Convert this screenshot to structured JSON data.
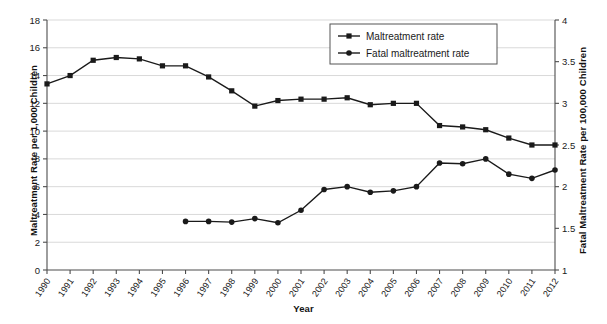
{
  "chart_data": {
    "type": "line",
    "title": "",
    "xlabel": "Year",
    "ylabel": "Maltreatment Rate per 1,000 Children",
    "ylabel_secondary": "Fatal Maltreatment Rate per 100,000 Children",
    "grid": true,
    "legend_position": "top-center",
    "ylim": [
      0,
      18
    ],
    "ylim_secondary": [
      1,
      4
    ],
    "yticks": [
      "0",
      "2",
      "4",
      "6",
      "8",
      "10",
      "12",
      "14",
      "16",
      "18"
    ],
    "yticks_secondary": [
      "1",
      "1.5",
      "2",
      "2.5",
      "3",
      "3.5",
      "4"
    ],
    "x": [
      1990,
      1991,
      1992,
      1993,
      1994,
      1995,
      1996,
      1997,
      1998,
      1999,
      2000,
      2001,
      2002,
      2003,
      2004,
      2005,
      2006,
      2007,
      2008,
      2009,
      2010,
      2011,
      2012
    ],
    "categories": [
      "1990",
      "1991",
      "1992",
      "1993",
      "1994",
      "1995",
      "1996",
      "1997",
      "1998",
      "1999",
      "2000",
      "2001",
      "2002",
      "2003",
      "2004",
      "2005",
      "2006",
      "2007",
      "2008",
      "2009",
      "2010",
      "2011",
      "2012"
    ],
    "series": [
      {
        "name": "Maltreatment rate",
        "axis": "left",
        "marker": "square",
        "color": "#1a1a1a",
        "values": [
          13.4,
          14.0,
          15.1,
          15.3,
          15.2,
          14.7,
          14.7,
          13.9,
          12.9,
          11.8,
          12.2,
          12.3,
          12.3,
          12.4,
          11.9,
          12.0,
          12.0,
          10.4,
          10.3,
          10.1,
          9.5,
          9.0,
          9.0
        ]
      },
      {
        "name": "Fatal maltreatment rate",
        "axis": "right",
        "marker": "circle",
        "color": "#1a1a1a",
        "values": [
          null,
          null,
          null,
          null,
          null,
          null,
          1.58,
          1.58,
          1.57,
          1.62,
          1.56,
          1.72,
          1.97,
          2.0,
          1.93,
          1.95,
          2.0,
          2.28,
          2.27,
          2.33,
          2.15,
          2.1,
          2.2
        ],
        "values_on_left_scale": [
          null,
          null,
          null,
          null,
          null,
          null,
          3.5,
          3.5,
          3.45,
          3.7,
          3.4,
          4.3,
          5.8,
          6.0,
          5.6,
          5.7,
          6.0,
          7.7,
          7.65,
          8.0,
          6.9,
          6.6,
          7.2
        ]
      }
    ]
  },
  "legend": {
    "items": [
      {
        "label": "Maltreatment rate",
        "marker": "square"
      },
      {
        "label": "Fatal maltreatment rate",
        "marker": "circle"
      }
    ]
  }
}
